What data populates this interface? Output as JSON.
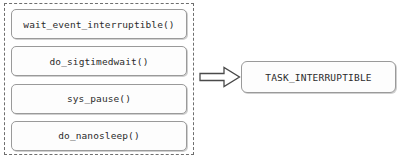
{
  "diagram": {
    "group": {
      "border_style": "dashed",
      "border_color": "#6e6e6e",
      "items": [
        {
          "label": "wait_event_interruptible()"
        },
        {
          "label": "do_sigtimedwait()"
        },
        {
          "label": "sys_pause()"
        },
        {
          "label": "do_nanosleep()"
        }
      ]
    },
    "arrow": {
      "icon": "block-arrow-right-icon",
      "direction": "right",
      "stroke_color": "#4a4a4a",
      "fill_color": "#ffffff"
    },
    "target": {
      "label": "TASK_INTERRUPTIBLE",
      "border_color": "#9a9a9a",
      "fill_color": "#fdfdfd"
    }
  }
}
